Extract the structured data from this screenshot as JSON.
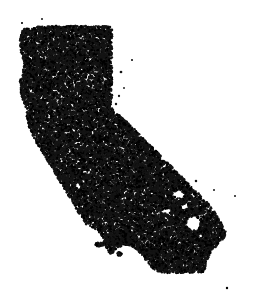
{
  "figure": {
    "title": "California Dot Density Map",
    "width": 256,
    "height": 304
  },
  "canvas": {
    "background_color": "#ffffff",
    "dot_color": "#141414",
    "dot_color_alt": "#000000",
    "dot_radius_px": 1.15,
    "dot_count": 18000,
    "island_dot_count": 420,
    "outlier_dot_count": 14
  },
  "chart_data": {
    "type": "scatter",
    "title": "California Dot Density Map",
    "subtitle": "",
    "xlabel": "",
    "ylabel": "",
    "xlim": [
      0,
      256
    ],
    "ylim": [
      0,
      304
    ],
    "grid": false,
    "legend": null,
    "axes_visible": false,
    "tick_labels": [],
    "annotations": [],
    "series": [
      {
        "name": "population-dots-mainland",
        "marker": "circle",
        "color": "#141414",
        "size_px": 2.3,
        "count": 18000,
        "description": "Randomly distributed dots filling the mainland polygon of California"
      },
      {
        "name": "population-dots-islands",
        "marker": "circle",
        "color": "#141414",
        "size_px": 2.3,
        "count": 420,
        "description": "Dots filling the Channel Islands and Farallon Islands polygons"
      },
      {
        "name": "outlier-dots",
        "marker": "circle",
        "color": "#141414",
        "size_px": 2.3,
        "count": 14,
        "description": "Isolated stray dots outside the main landmass"
      }
    ],
    "geometry": {
      "mainland_polygon": [
        [
          26,
          28
        ],
        [
          38,
          27
        ],
        [
          52,
          26
        ],
        [
          66,
          26
        ],
        [
          80,
          26
        ],
        [
          94,
          26
        ],
        [
          106,
          26
        ],
        [
          112,
          27
        ],
        [
          112,
          44
        ],
        [
          112,
          62
        ],
        [
          112,
          80
        ],
        [
          112,
          96
        ],
        [
          111,
          107
        ],
        [
          120,
          116
        ],
        [
          129,
          124
        ],
        [
          138,
          133
        ],
        [
          147,
          142
        ],
        [
          156,
          151
        ],
        [
          164,
          159
        ],
        [
          172,
          167
        ],
        [
          179,
          174
        ],
        [
          186,
          181
        ],
        [
          193,
          188
        ],
        [
          199,
          194
        ],
        [
          205,
          200
        ],
        [
          210,
          206
        ],
        [
          214,
          211
        ],
        [
          217,
          216
        ],
        [
          220,
          221
        ],
        [
          223,
          226
        ],
        [
          226,
          232
        ],
        [
          224,
          238
        ],
        [
          220,
          243
        ],
        [
          215,
          248
        ],
        [
          211,
          253
        ],
        [
          208,
          258
        ],
        [
          206,
          263
        ],
        [
          205,
          268
        ],
        [
          203,
          272
        ],
        [
          197,
          273
        ],
        [
          189,
          273
        ],
        [
          181,
          273
        ],
        [
          173,
          273
        ],
        [
          165,
          273
        ],
        [
          158,
          272
        ],
        [
          152,
          268
        ],
        [
          148,
          263
        ],
        [
          144,
          258
        ],
        [
          140,
          253
        ],
        [
          136,
          249
        ],
        [
          131,
          246
        ],
        [
          126,
          245
        ],
        [
          121,
          246
        ],
        [
          117,
          249
        ],
        [
          113,
          251
        ],
        [
          109,
          250
        ],
        [
          106,
          247
        ],
        [
          104,
          243
        ],
        [
          103,
          238
        ],
        [
          101,
          234
        ],
        [
          98,
          231
        ],
        [
          94,
          229
        ],
        [
          90,
          227
        ],
        [
          86,
          224
        ],
        [
          83,
          220
        ],
        [
          80,
          215
        ],
        [
          77,
          210
        ],
        [
          74,
          205
        ],
        [
          71,
          200
        ],
        [
          68,
          195
        ],
        [
          65,
          190
        ],
        [
          62,
          185
        ],
        [
          59,
          180
        ],
        [
          56,
          175
        ],
        [
          53,
          170
        ],
        [
          50,
          165
        ],
        [
          47,
          160
        ],
        [
          44,
          155
        ],
        [
          41,
          150
        ],
        [
          38,
          145
        ],
        [
          35,
          140
        ],
        [
          32,
          135
        ],
        [
          30,
          130
        ],
        [
          28,
          124
        ],
        [
          27,
          118
        ],
        [
          27,
          112
        ],
        [
          25,
          106
        ],
        [
          23,
          100
        ],
        [
          21,
          94
        ],
        [
          20,
          88
        ],
        [
          20,
          82
        ],
        [
          21,
          76
        ],
        [
          23,
          70
        ],
        [
          24,
          64
        ],
        [
          23,
          58
        ],
        [
          21,
          52
        ],
        [
          20,
          46
        ],
        [
          20,
          40
        ],
        [
          21,
          34
        ],
        [
          23,
          30
        ]
      ],
      "island_polygons": [
        {
          "name": "santa-rosa-island",
          "points": [
            [
              104,
              239
            ],
            [
              112,
              238
            ],
            [
              118,
              240
            ],
            [
              120,
              243
            ],
            [
              114,
              245
            ],
            [
              106,
              244
            ],
            [
              102,
              242
            ]
          ]
        },
        {
          "name": "santa-cruz-island",
          "points": [
            [
              121,
              240
            ],
            [
              130,
              239
            ],
            [
              135,
              241
            ],
            [
              133,
              244
            ],
            [
              126,
              245
            ],
            [
              120,
              243
            ]
          ]
        },
        {
          "name": "san-miguel-island",
          "points": [
            [
              96,
              243
            ],
            [
              102,
              242
            ],
            [
              104,
              245
            ],
            [
              99,
              247
            ],
            [
              95,
              246
            ]
          ]
        },
        {
          "name": "anacapa-island",
          "points": [
            [
              136,
              241
            ],
            [
              140,
              241
            ],
            [
              141,
              243
            ],
            [
              137,
              244
            ]
          ]
        },
        {
          "name": "santa-barbara-island",
          "points": [
            [
              117,
              252
            ],
            [
              121,
              252
            ],
            [
              122,
              255
            ],
            [
              118,
              256
            ]
          ]
        },
        {
          "name": "santa-catalina-island",
          "points": [
            [
              147,
              249
            ],
            [
              153,
              248
            ],
            [
              157,
              251
            ],
            [
              158,
              255
            ],
            [
              154,
              257
            ],
            [
              149,
              256
            ],
            [
              146,
              253
            ]
          ]
        },
        {
          "name": "san-nicolas-island",
          "points": [
            [
              108,
              250
            ],
            [
              113,
              250
            ],
            [
              114,
              253
            ],
            [
              109,
              254
            ]
          ]
        },
        {
          "name": "san-clemente-island",
          "points": [
            [
              155,
              262
            ],
            [
              161,
              261
            ],
            [
              166,
              265
            ],
            [
              168,
              270
            ],
            [
              164,
              271
            ],
            [
              159,
              268
            ],
            [
              155,
              265
            ]
          ]
        },
        {
          "name": "farallon-islands",
          "points": [
            [
              41,
              148
            ],
            [
              45,
              147
            ],
            [
              46,
              150
            ],
            [
              42,
              151
            ]
          ]
        },
        {
          "name": "farallon-islands-south",
          "points": [
            [
              48,
              147
            ],
            [
              52,
              146
            ],
            [
              53,
              149
            ],
            [
              49,
              150
            ]
          ]
        }
      ],
      "void_polygons": [
        {
          "name": "salton-sea",
          "points": [
            [
              188,
              218
            ],
            [
              196,
              216
            ],
            [
              201,
              222
            ],
            [
              199,
              229
            ],
            [
              192,
              231
            ],
            [
              186,
              226
            ]
          ]
        },
        {
          "name": "lake-tahoe",
          "points": [
            [
              113,
              109
            ],
            [
              118,
              108
            ],
            [
              119,
              114
            ],
            [
              114,
              115
            ]
          ]
        },
        {
          "name": "desert-void-a",
          "points": [
            [
              173,
              192
            ],
            [
              181,
              190
            ],
            [
              184,
              195
            ],
            [
              178,
              198
            ],
            [
              172,
              196
            ]
          ]
        },
        {
          "name": "desert-void-b",
          "points": [
            [
              163,
              209
            ],
            [
              170,
              208
            ],
            [
              172,
              212
            ],
            [
              166,
              214
            ],
            [
              162,
              212
            ]
          ]
        },
        {
          "name": "desert-void-c",
          "points": [
            [
              180,
              205
            ],
            [
              187,
              204
            ],
            [
              189,
              208
            ],
            [
              183,
              210
            ]
          ]
        },
        {
          "name": "coastal-void",
          "points": [
            [
              118,
              258
            ],
            [
              126,
              257
            ],
            [
              128,
              261
            ],
            [
              121,
              263
            ],
            [
              116,
              261
            ]
          ]
        }
      ],
      "outlier_points": [
        [
          42,
          19
        ],
        [
          22,
          23
        ],
        [
          132,
          60
        ],
        [
          121,
          72
        ],
        [
          124,
          88
        ],
        [
          119,
          96
        ],
        [
          116,
          104
        ],
        [
          214,
          190
        ],
        [
          235,
          196
        ],
        [
          196,
          181
        ],
        [
          227,
          288
        ],
        [
          39,
          146
        ],
        [
          50,
          145
        ],
        [
          113,
          250
        ]
      ]
    }
  }
}
